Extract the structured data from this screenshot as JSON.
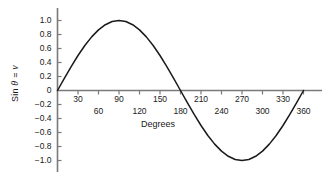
{
  "chart_data": {
    "type": "line",
    "title": "",
    "xlabel": "Degrees",
    "ylabel": "Sin θ = v",
    "ylabel_parts": {
      "prefix": "Sin ",
      "theta": "θ",
      "middle": " = ",
      "v": "v"
    },
    "xlim": [
      0,
      390
    ],
    "ylim": [
      -1.0,
      1.0
    ],
    "grid": false,
    "legend": null,
    "x_tick_labels_upper": [
      "30",
      "90",
      "150",
      "210",
      "270",
      "330"
    ],
    "x_tick_values_upper": [
      30,
      90,
      150,
      210,
      270,
      330
    ],
    "x_tick_labels_lower": [
      "60",
      "120",
      "180",
      "240",
      "300",
      "360"
    ],
    "x_tick_values_lower": [
      60,
      120,
      180,
      240,
      300,
      360
    ],
    "y_tick_labels": [
      "1.0",
      "0.8",
      "0.6",
      "0.4",
      "0.2",
      "0",
      "−0.2",
      "−0.4",
      "−0.6",
      "−0.8",
      "−1.0"
    ],
    "y_tick_values": [
      1.0,
      0.8,
      0.6,
      0.4,
      0.2,
      0,
      -0.2,
      -0.4,
      -0.6,
      -0.8,
      -1.0
    ],
    "series": [
      {
        "name": "sin θ",
        "color": "#1a1a1a",
        "x": [
          0,
          10,
          20,
          30,
          40,
          50,
          60,
          70,
          80,
          90,
          100,
          110,
          120,
          130,
          140,
          150,
          160,
          170,
          180,
          190,
          200,
          210,
          220,
          230,
          240,
          250,
          260,
          270,
          280,
          290,
          300,
          310,
          320,
          330,
          340,
          350,
          360
        ],
        "values": [
          0.0,
          0.174,
          0.342,
          0.5,
          0.643,
          0.766,
          0.866,
          0.94,
          0.985,
          1.0,
          0.985,
          0.94,
          0.866,
          0.766,
          0.643,
          0.5,
          0.342,
          0.174,
          0.0,
          -0.174,
          -0.342,
          -0.5,
          -0.643,
          -0.766,
          -0.866,
          -0.94,
          -0.985,
          -1.0,
          -0.985,
          -0.94,
          -0.866,
          -0.766,
          -0.643,
          -0.5,
          -0.342,
          -0.174,
          0.0
        ]
      }
    ],
    "axis_color": "#6e6e6e",
    "curve_color": "#1a1a1a",
    "background": "#ffffff"
  }
}
